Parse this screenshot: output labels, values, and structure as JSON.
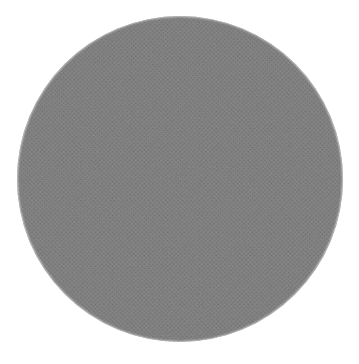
{
  "image": {
    "kind": "grayscale-sphere-photograph",
    "subject": "shaded sphere / planetary body",
    "rendering": "scanned halftone dot screen",
    "width": 359,
    "height": 364,
    "background_color": "#ffffff",
    "alt_text": "A large grayscale sphere filling the frame on a white background, rendered as a scanned halftone print with dark patches in the upper left and upper right and a bright highlight in the lower left."
  },
  "sphere": {
    "center_x": 180,
    "center_y": 179,
    "radius": 163,
    "base_color": "#7c7c7c",
    "darkest_color": "#101010",
    "brightest_color": "#fbfbfb",
    "edge_color": "#ffffff"
  },
  "chart_data": {
    "type": "heatmap",
    "title": "",
    "xlabel": "",
    "ylabel": "",
    "colormap": "grayscale",
    "value_range": [
      0,
      255
    ],
    "geometry": {
      "shape": "disc",
      "center": [
        180,
        179
      ],
      "radius": 163,
      "bounds": {
        "left": 18,
        "top": 10,
        "right": 342,
        "bottom": 348
      }
    },
    "features": [
      {
        "name": "dark-patch-upper-left",
        "kind": "dark",
        "center": [
          105,
          80
        ],
        "radius": 62,
        "gray_value": 18,
        "hex": "#121212"
      },
      {
        "name": "dark-patch-upper-right",
        "kind": "dark",
        "center": [
          283,
          74
        ],
        "radius": 66,
        "gray_value": 26,
        "hex": "#1a1a1a"
      },
      {
        "name": "dark-band-upper-center",
        "kind": "dark",
        "center": [
          196,
          62
        ],
        "radius": 78,
        "gray_value": 48,
        "hex": "#303030"
      },
      {
        "name": "dark-region-left-flank",
        "kind": "dark",
        "center": [
          72,
          120
        ],
        "radius": 52,
        "gray_value": 58,
        "hex": "#3a3a3a"
      },
      {
        "name": "highlight-lower-left",
        "kind": "bright",
        "center": [
          118,
          266
        ],
        "radius": 72,
        "gray_value": 243,
        "hex": "#f3f3f3"
      },
      {
        "name": "highlight-left-limb",
        "kind": "bright",
        "center": [
          28,
          182
        ],
        "radius": 40,
        "gray_value": 234,
        "hex": "#eaeaea"
      },
      {
        "name": "highlight-bottom-limb",
        "kind": "bright",
        "center": [
          196,
          330
        ],
        "radius": 62,
        "gray_value": 240,
        "hex": "#f0f0f0"
      },
      {
        "name": "mid-tone-center",
        "kind": "neutral",
        "center": [
          182,
          180
        ],
        "radius": 70,
        "gray_value": 122,
        "hex": "#7a7a7a"
      },
      {
        "name": "mid-light-right-flank",
        "kind": "bright",
        "center": [
          300,
          200
        ],
        "radius": 58,
        "gray_value": 150,
        "hex": "#969696"
      },
      {
        "name": "mid-light-lower-right",
        "kind": "bright",
        "center": [
          262,
          286
        ],
        "radius": 60,
        "gray_value": 176,
        "hex": "#b0b0b0"
      },
      {
        "name": "right-limb-rim",
        "kind": "bright",
        "center": [
          334,
          172
        ],
        "radius": 26,
        "gray_value": 198,
        "hex": "#c6c6c6"
      }
    ],
    "profile_note": "Brightness increases toward the lower-left and bottom limb; the upper hemisphere is strongly darkened with two distinct dark maculae."
  }
}
